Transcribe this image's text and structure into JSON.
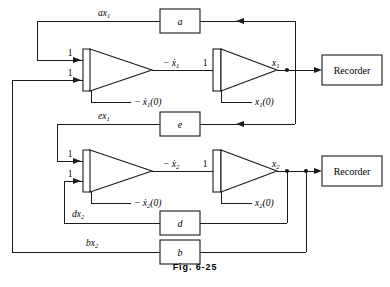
{
  "figure": {
    "caption": "Fig. 6-25"
  },
  "blocks": {
    "coefficient_a": {
      "label": "a",
      "name": "coefficient-block-a"
    },
    "coefficient_e": {
      "label": "e",
      "name": "coefficient-block-e"
    },
    "coefficient_d": {
      "label": "d",
      "name": "coefficient-block-d"
    },
    "coefficient_b": {
      "label": "b",
      "name": "coefficient-block-b"
    },
    "recorder_top": {
      "label": "Recorder",
      "name": "recorder-top"
    },
    "recorder_bottom": {
      "label": "Recorder",
      "name": "recorder-bottom"
    }
  },
  "amplifiers": {
    "integrator_1": {
      "input_gain_top": "1",
      "input_gain_bottom": "1",
      "output_label": "− ẋ₁",
      "initial_condition": "− ẋ₁(0)"
    },
    "integrator_2": {
      "input_gain": "1",
      "output_label": "x₁",
      "initial_condition": "x₁(0)"
    },
    "integrator_3": {
      "input_gain_top": "1",
      "input_gain_bottom": "1",
      "output_label": "− ẋ₂",
      "initial_condition": "− ẋ₂(0)"
    },
    "integrator_4": {
      "input_gain": "1",
      "output_label": "x₂",
      "initial_condition": "x₂(0)"
    }
  },
  "signals": {
    "feedback_ax1": "ax₁",
    "feedback_ex1": "ex₁",
    "feedback_dx2": "dx₂",
    "feedback_bx2": "bx₂"
  },
  "labels": {
    "minus_x1dot": {
      "sign": "−",
      "base": "ẋ",
      "sub": "1"
    },
    "minus_x1dot_ic": {
      "sign": "−",
      "base": "ẋ",
      "sub": "1",
      "suffix": "(0)"
    },
    "x1": {
      "base": "x",
      "sub": "1"
    },
    "x1_ic": {
      "base": "x",
      "sub": "1",
      "suffix": "(0)"
    },
    "minus_x2dot": {
      "sign": "−",
      "base": "ẋ",
      "sub": "2"
    },
    "minus_x2dot_ic": {
      "sign": "−",
      "base": "ẋ",
      "sub": "2",
      "suffix": "(0)"
    },
    "x2": {
      "base": "x",
      "sub": "2"
    },
    "x2_ic": {
      "base": "x",
      "sub": "2",
      "suffix": "(0)"
    },
    "ax1": {
      "base": "ax",
      "sub": "1"
    },
    "ex1": {
      "base": "ex",
      "sub": "1"
    },
    "dx2": {
      "base": "dx",
      "sub": "2"
    },
    "bx2": {
      "base": "bx",
      "sub": "2"
    },
    "gain_one": "1"
  },
  "colors": {
    "line": "#1a1a1a",
    "background": "#ffffff",
    "text": "#000000"
  }
}
